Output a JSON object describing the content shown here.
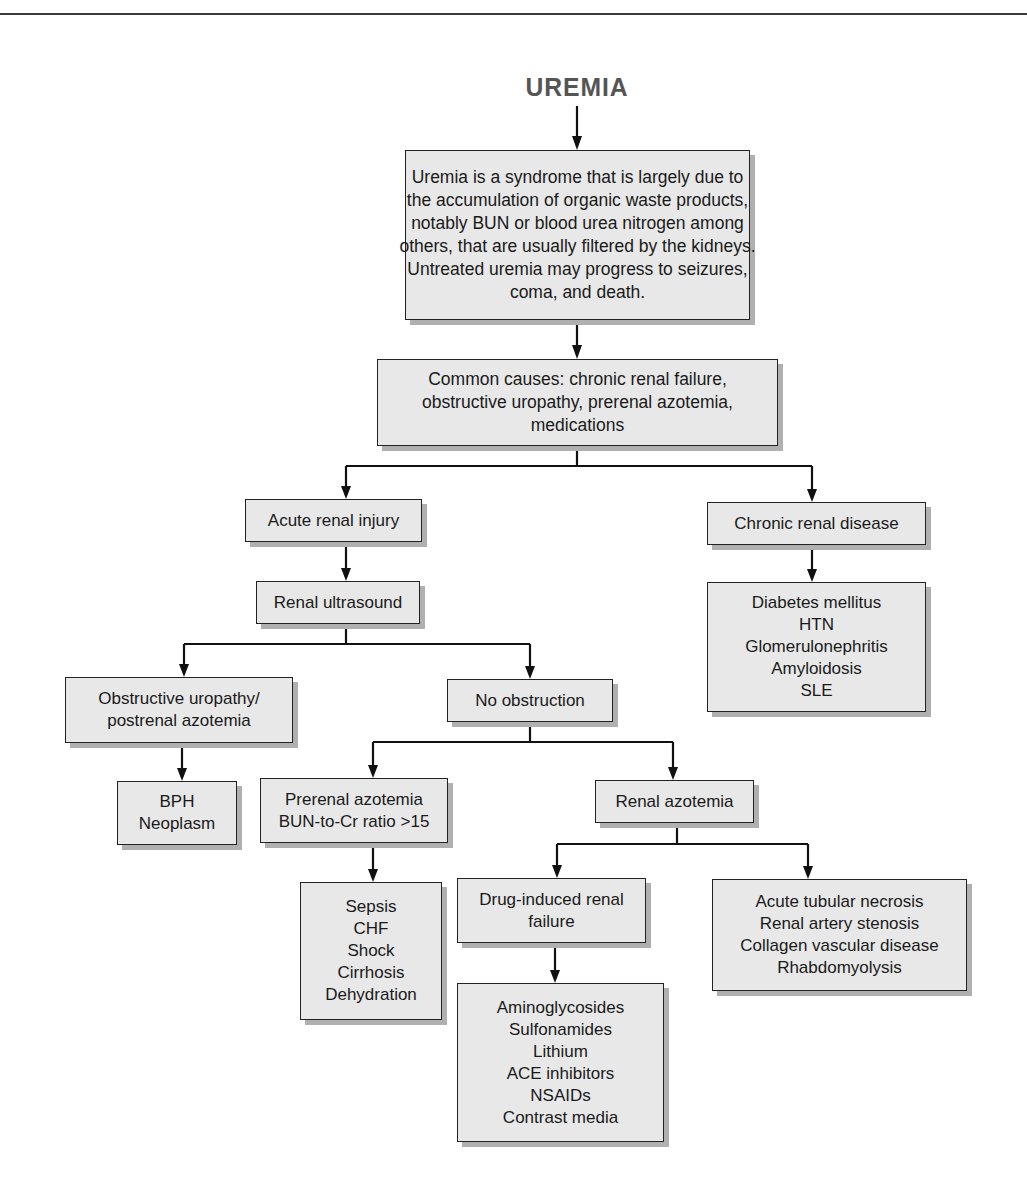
{
  "title": "UREMIA",
  "nodes": {
    "definition": {
      "lines": [
        "Uremia is a syndrome that is largely due to",
        "the accumulation of organic waste products,",
        "notably BUN or blood urea nitrogen among",
        "others, that are usually filtered by the kidneys.",
        "Untreated uremia may progress to seizures,",
        "coma, and death."
      ]
    },
    "common_causes": {
      "lines": [
        "Common causes: chronic renal failure,",
        "obstructive uropathy, prerenal azotemia,",
        "medications"
      ]
    },
    "acute_renal_injury": {
      "lines": [
        "Acute renal injury"
      ]
    },
    "chronic_renal_disease": {
      "lines": [
        "Chronic renal disease"
      ]
    },
    "chronic_causes": {
      "lines": [
        "Diabetes mellitus",
        "HTN",
        "Glomerulonephritis",
        "Amyloidosis",
        "SLE"
      ]
    },
    "renal_ultrasound": {
      "lines": [
        "Renal ultrasound"
      ]
    },
    "obstructive_uropathy": {
      "lines": [
        "Obstructive uropathy/",
        "postrenal azotemia"
      ]
    },
    "no_obstruction": {
      "lines": [
        "No obstruction"
      ]
    },
    "obstructive_causes": {
      "lines": [
        "BPH",
        "Neoplasm"
      ]
    },
    "prerenal_azotemia": {
      "lines": [
        "Prerenal azotemia",
        "BUN-to-Cr ratio >15"
      ]
    },
    "renal_azotemia": {
      "lines": [
        "Renal azotemia"
      ]
    },
    "prerenal_causes": {
      "lines": [
        "Sepsis",
        "CHF",
        "Shock",
        "Cirrhosis",
        "Dehydration"
      ]
    },
    "drug_induced": {
      "lines": [
        "Drug-induced renal",
        "failure"
      ]
    },
    "intrinsic_causes": {
      "lines": [
        "Acute tubular necrosis",
        "Renal artery stenosis",
        "Collagen vascular disease",
        "Rhabdomyolysis"
      ]
    },
    "drug_list": {
      "lines": [
        "Aminoglycosides",
        "Sulfonamides",
        "Lithium",
        "ACE inhibitors",
        "NSAIDs",
        "Contrast media"
      ]
    }
  },
  "colors": {
    "box_fill": "#e8e8e8",
    "box_border": "#222222",
    "box_shadow": "#b0b0b0",
    "title": "#555555",
    "line": "#111111"
  }
}
